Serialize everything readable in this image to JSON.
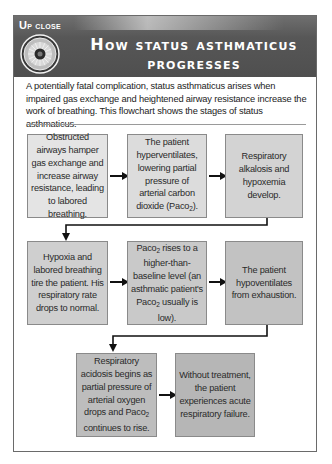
{
  "header": {
    "label_first": "U",
    "label_rest": "p close",
    "title_line1": "How status asthmaticus",
    "title_line2": "progresses",
    "icon": "eye-lens-icon",
    "colors": {
      "band": "#555555",
      "text": "#ffffff"
    }
  },
  "intro": "A potentially fatal complication, status asthmaticus arises when impaired gas exchange and heightened airway resistance increase the work of breathing. This flowchart shows the stages of status asthmaticus.",
  "flowchart": {
    "rows": [
      {
        "steps": [
          {
            "text": "Obstructed airways hamper gas exchange and increase airway resistance, leading to labored breathing.",
            "fill": "#e4e4e4"
          },
          {
            "pre": "The patient hyperventilates, lowering partial pressure of arterial carbon dioxide (Paco",
            "sub": "2",
            "post": ").",
            "fill": "#dcdcdc"
          },
          {
            "text": "Respiratory alkalosis and hypoxemia develop.",
            "fill": "#d3d3d3"
          }
        ]
      },
      {
        "steps": [
          {
            "text": "Hypoxia and labored breathing tire the patient. His respiratory rate drops to normal.",
            "fill": "#cfcfcf"
          },
          {
            "pre": "Paco",
            "sub": "2",
            "mid": " rises to a higher-than-baseline level (an asthmatic patient's Paco",
            "sub2": "2",
            "post": " usually is low).",
            "fill": "#c9c9c9"
          },
          {
            "text": "The patient hypoventilates from exhaustion.",
            "fill": "#c2c2c2"
          }
        ]
      },
      {
        "steps": [
          {
            "pre": "Respiratory acidosis begins as partial pressure of arterial oxygen drops and Paco",
            "sub": "2",
            "post": " continues to rise.",
            "fill": "#bdbdbd"
          },
          {
            "text": "Without treatment, the patient experiences acute respiratory failure.",
            "fill": "#b6b6b6"
          }
        ]
      }
    ],
    "arrow_color": "#111111"
  }
}
